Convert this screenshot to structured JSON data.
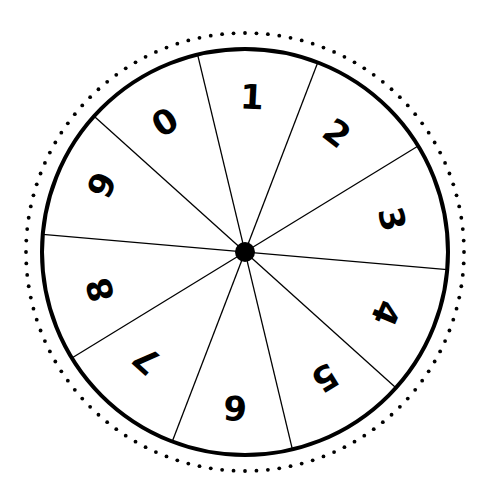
{
  "wheel": {
    "center": [
      245,
      252
    ],
    "radius": 203,
    "dot_ring_radius": 219,
    "hub_radius": 10,
    "stroke_color": "#000000",
    "background": "#ffffff",
    "divider_angles_deg": [
      -69,
      -103.5,
      -138,
      -175,
      148.5
    ],
    "segments": [
      {
        "label": "0",
        "x": 165,
        "y": 122,
        "rotate": -32
      },
      {
        "label": "1",
        "x": 252,
        "y": 97,
        "rotate": 3
      },
      {
        "label": "2",
        "x": 337,
        "y": 133,
        "rotate": 38
      },
      {
        "label": "3",
        "x": 392,
        "y": 219,
        "rotate": 77
      },
      {
        "label": "4",
        "x": 386,
        "y": 313,
        "rotate": 113
      },
      {
        "label": "5",
        "x": 325,
        "y": 378,
        "rotate": 148
      },
      {
        "label": "6",
        "x": 235,
        "y": 408,
        "rotate": 184
      },
      {
        "label": "7",
        "x": 147,
        "y": 360,
        "rotate": 222
      },
      {
        "label": "8",
        "x": 100,
        "y": 290,
        "rotate": 255
      },
      {
        "label": "9",
        "x": 102,
        "y": 185,
        "rotate": 295
      }
    ]
  }
}
